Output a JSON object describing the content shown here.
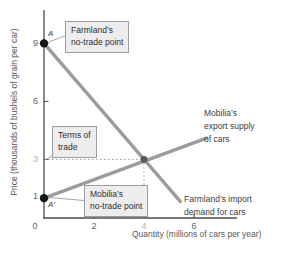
{
  "axes": {
    "y_label": "Price (thousands of bushels of grain per car)",
    "x_label": "Quantity (millions of cars per year)",
    "y_ticks": [
      {
        "label": "9"
      },
      {
        "label": "6"
      },
      {
        "label": "3"
      },
      {
        "label": "1"
      }
    ],
    "x_ticks": [
      {
        "label": "0"
      },
      {
        "label": "2"
      },
      {
        "label": "4"
      },
      {
        "label": "6"
      }
    ]
  },
  "annotations": {
    "farmland_no_trade": [
      "Farmland’s",
      "no-trade point"
    ],
    "terms_of_trade": [
      "Terms of",
      "trade"
    ],
    "mobilia_no_trade": [
      "Mobilia’s",
      "no-trade point"
    ],
    "export_supply": [
      "Mobilia’s",
      "export supply",
      "of cars"
    ],
    "import_demand": [
      "Farmland’s import",
      "demand for cars"
    ],
    "point_a": "A",
    "point_a_prime": "A′"
  },
  "chart_data": {
    "type": "line",
    "xlabel": "Quantity (millions of cars per year)",
    "ylabel": "Price (thousands of bushels of grain per car)",
    "xlim": [
      0,
      7.7
    ],
    "ylim": [
      0,
      10.7
    ],
    "x_tick_values": [
      0,
      2,
      4,
      6
    ],
    "y_tick_values": [
      1,
      3,
      6,
      9
    ],
    "series": [
      {
        "name": "Farmland’s import demand for cars",
        "points": [
          [
            0,
            9
          ],
          [
            5.45,
            0.83
          ]
        ],
        "color": "#9a9c9e"
      },
      {
        "name": "Mobilia’s export supply of cars",
        "points": [
          [
            0,
            1
          ],
          [
            6.5,
            4.1
          ]
        ],
        "color": "#9a9c9e"
      }
    ],
    "equilibrium": {
      "x": 4,
      "y": 3
    },
    "no_trade_points": [
      {
        "label": "A",
        "x": 0,
        "y": 9
      },
      {
        "label": "A′",
        "x": 0,
        "y": 1
      }
    ],
    "dashed_guides": [
      {
        "from": [
          0,
          3
        ],
        "to": [
          4,
          3
        ]
      },
      {
        "from": [
          4,
          3
        ],
        "to": [
          4,
          0
        ]
      }
    ],
    "grid": false,
    "legend": "none"
  },
  "colors": {
    "curve": "#9a9c9e",
    "axis": "#4b4c4e",
    "dashed": "#9b9da0",
    "leader": "#9b9da0",
    "no_trade_dot": "#161616",
    "eq_dot": "#58595b",
    "callout_bg": "#ededee",
    "callout_border": "#9b9da0"
  }
}
